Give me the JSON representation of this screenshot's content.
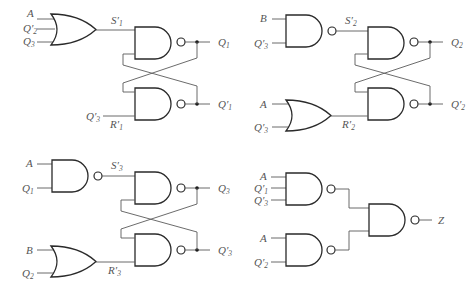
{
  "circuits": [
    {
      "id": "latch1",
      "set_gate": {
        "type": "OR",
        "inputs": [
          "A",
          "Q'2",
          "Q3"
        ],
        "output": "S'1"
      },
      "reset_input": "Q'3",
      "reset_label": "R'1",
      "outputs": [
        "Q1",
        "Q'1"
      ]
    },
    {
      "id": "latch2",
      "set_gate": {
        "type": "NAND",
        "inputs": [
          "B",
          "Q'3"
        ],
        "output": "S'2"
      },
      "reset_gate": {
        "type": "OR",
        "inputs": [
          "A",
          "Q'3"
        ],
        "output": "R'2"
      },
      "outputs": [
        "Q2",
        "Q'2"
      ]
    },
    {
      "id": "latch3",
      "set_gate": {
        "type": "NAND",
        "inputs": [
          "A",
          "Q1"
        ],
        "output": "S'3"
      },
      "reset_gate": {
        "type": "OR",
        "inputs": [
          "B",
          "Q2"
        ],
        "output": "R'3"
      },
      "outputs": [
        "Q3",
        "Q'3"
      ]
    },
    {
      "id": "output_logic",
      "gate1": {
        "type": "NAND",
        "inputs": [
          "A",
          "Q'1",
          "Q'3"
        ]
      },
      "gate2": {
        "type": "NAND",
        "inputs": [
          "A",
          "Q'2"
        ]
      },
      "final": {
        "type": "NAND",
        "output": "Z"
      }
    }
  ],
  "labels": {
    "p1": {
      "in_a": "A",
      "in_q2p": "Q",
      "in_q2p_sub": "2",
      "in_q3": "Q",
      "in_q3_sub": "3",
      "s": "S",
      "s_sub": "1",
      "q": "Q",
      "q_sub": "1",
      "qp": "Q",
      "qp_sub": "1",
      "r_in": "Q",
      "r_in_sub": "3",
      "r": "R",
      "r_sub": "1"
    },
    "p2": {
      "in_b": "B",
      "in_q3p": "Q",
      "in_q3p_sub": "3",
      "s": "S",
      "s_sub": "2",
      "q": "Q",
      "q_sub": "2",
      "qp": "Q",
      "qp_sub": "2",
      "in_a": "A",
      "in_q3p2": "Q",
      "in_q3p2_sub": "3",
      "r": "R",
      "r_sub": "2"
    },
    "p3": {
      "in_a": "A",
      "in_q1": "Q",
      "in_q1_sub": "1",
      "s": "S",
      "s_sub": "3",
      "q": "Q",
      "q_sub": "3",
      "qp": "Q",
      "qp_sub": "3",
      "in_b": "B",
      "in_q2": "Q",
      "in_q2_sub": "2",
      "r": "R",
      "r_sub": "3"
    },
    "p4": {
      "in_a1": "A",
      "in_q1p": "Q",
      "in_q1p_sub": "1",
      "in_q3p": "Q",
      "in_q3p_sub": "3",
      "in_a2": "A",
      "in_q2p": "Q",
      "in_q2p_sub": "2",
      "z": "Z"
    }
  }
}
